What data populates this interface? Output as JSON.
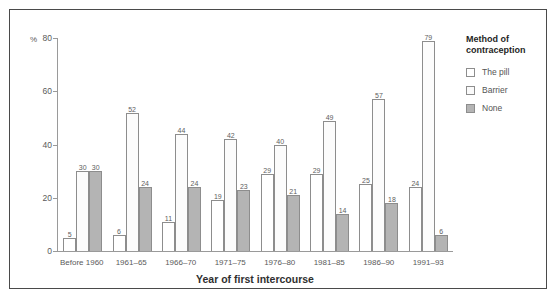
{
  "chart_data": {
    "type": "bar",
    "title": "",
    "xlabel": "Year of first intercourse",
    "ylabel": "%",
    "ylim": [
      0,
      80
    ],
    "yticks": [
      0,
      20,
      40,
      60,
      80
    ],
    "grid": false,
    "legend_position": "right",
    "legend_title": "Method of contraception",
    "categories": [
      "Before 1960",
      "1961–65",
      "1966–70",
      "1971–75",
      "1976–80",
      "1981–85",
      "1986–90",
      "1991–93"
    ],
    "series": [
      {
        "name": "The pill",
        "color": "#ffffff",
        "values": [
          5,
          6,
          11,
          19,
          29,
          29,
          25,
          24
        ]
      },
      {
        "name": "Barrier",
        "color": "#fcfcfc",
        "values": [
          30,
          52,
          44,
          42,
          40,
          49,
          57,
          79
        ]
      },
      {
        "name": "None",
        "color": "#b4b4b4",
        "values": [
          30,
          24,
          24,
          23,
          21,
          14,
          18,
          6
        ]
      }
    ]
  },
  "axis": {
    "y_unit": "%",
    "y_tick_labels": [
      "0",
      "20",
      "40",
      "60",
      "80"
    ]
  },
  "legend": {
    "title_line1": "Method of",
    "title_line2": "contraception",
    "items": [
      {
        "label": "The pill"
      },
      {
        "label": "Barrier"
      },
      {
        "label": "None"
      }
    ]
  }
}
